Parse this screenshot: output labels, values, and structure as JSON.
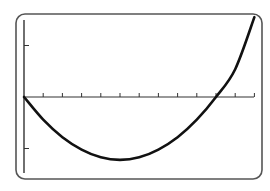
{
  "chart_data": {
    "type": "line",
    "title": "",
    "xlabel": "",
    "ylabel": "",
    "grid": false,
    "legend": null,
    "x_ticks_count": 12,
    "y_ticks": [
      -1,
      1
    ],
    "xlim": [
      0,
      12
    ],
    "ylim": [
      -1.5,
      1.5
    ],
    "series": [
      {
        "name": "parabola",
        "description": "Upward-opening parabola through the origin, minimum near x=5, second root near x=10",
        "x": [
          0,
          1,
          2,
          3,
          4,
          5,
          6,
          7,
          8,
          9,
          10,
          11,
          12
        ],
        "y": [
          0,
          -0.44,
          -0.78,
          -1.02,
          -1.17,
          -1.22,
          -1.17,
          -1.02,
          -0.78,
          -0.44,
          0.0,
          0.54,
          1.55
        ]
      }
    ],
    "annotations": []
  },
  "style": {
    "frame_color": "#555555",
    "axis_color": "#333333",
    "curve_color": "#111111",
    "background": "#ffffff"
  },
  "layout": {
    "frame": {
      "x": 16,
      "y": 14,
      "w": 246,
      "h": 165,
      "r": 9
    },
    "origin_px": {
      "x": 24,
      "y": 97
    },
    "x_axis_end_px": 254,
    "y_axis_top_px": 20,
    "y_axis_bottom_px": 173,
    "x_unit_px": 19.2,
    "y_unit_px": 51.5
  }
}
